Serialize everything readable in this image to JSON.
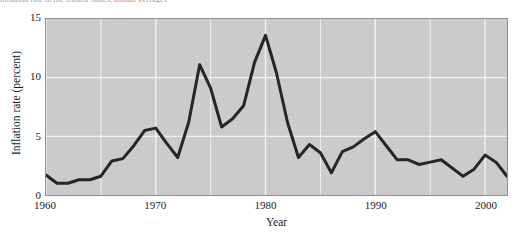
{
  "figure": {
    "caption_fragment": "Inflation rate in the United States, annual averages"
  },
  "chart_data": {
    "type": "line",
    "title": "",
    "xlabel": "Year",
    "ylabel": "Inflation rate (percent)",
    "xlim": [
      1960,
      2002
    ],
    "ylim": [
      0,
      15
    ],
    "xticks": [
      1960,
      1970,
      1980,
      1990,
      2000
    ],
    "xtick_labels": [
      "1960",
      "1970",
      "1980",
      "1990",
      "2000"
    ],
    "yticks": [
      0,
      5,
      10,
      15
    ],
    "ytick_labels": [
      "0",
      "5",
      "10",
      "15"
    ],
    "grid": "both-minor-5yr-and-5pct",
    "grid_color": "#f2f2f2",
    "plot_background": "#cbcbcb",
    "line_color": "#262626",
    "line_width": 3,
    "legend": "none",
    "x": [
      1960,
      1961,
      1962,
      1963,
      1964,
      1965,
      1966,
      1967,
      1968,
      1969,
      1970,
      1971,
      1972,
      1973,
      1974,
      1975,
      1976,
      1977,
      1978,
      1979,
      1980,
      1981,
      1982,
      1983,
      1984,
      1985,
      1986,
      1987,
      1988,
      1989,
      1990,
      1991,
      1992,
      1993,
      1994,
      1995,
      1996,
      1997,
      1998,
      1999,
      2000,
      2001,
      2002
    ],
    "values": [
      1.7,
      1.0,
      1.0,
      1.3,
      1.3,
      1.6,
      2.9,
      3.1,
      4.2,
      5.5,
      5.7,
      4.4,
      3.2,
      6.2,
      11.1,
      9.1,
      5.8,
      6.5,
      7.6,
      11.3,
      13.6,
      10.4,
      6.2,
      3.2,
      4.3,
      3.6,
      1.9,
      3.7,
      4.1,
      4.8,
      5.4,
      4.2,
      3.0,
      3.0,
      2.6,
      2.8,
      3.0,
      2.3,
      1.6,
      2.2,
      3.4,
      2.8,
      1.6
    ]
  }
}
